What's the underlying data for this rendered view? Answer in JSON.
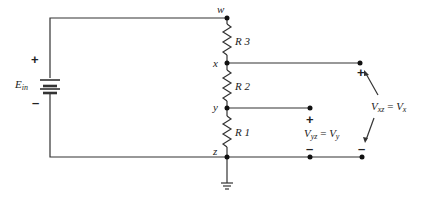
{
  "diagram": {
    "type": "circuit-schematic",
    "colors": {
      "wire": "#333333",
      "text": "#222222",
      "background": "#ffffff"
    },
    "source": {
      "label": "E",
      "label_sub": "in",
      "plus": "+",
      "minus": "–"
    },
    "nodes": {
      "w": "w",
      "x": "x",
      "y": "y",
      "z": "z"
    },
    "resistors": [
      {
        "id": "R3",
        "label": "R 3",
        "between": [
          "w",
          "x"
        ]
      },
      {
        "id": "R2",
        "label": "R 2",
        "between": [
          "x",
          "y"
        ]
      },
      {
        "id": "R1",
        "label": "R 1",
        "between": [
          "y",
          "z"
        ]
      }
    ],
    "measurements": {
      "vyz": {
        "plus": "+",
        "minus": "–",
        "lhs": "V",
        "lhs_sub": "yz",
        "eq": " = ",
        "rhs": "V",
        "rhs_sub": "y"
      },
      "vxz": {
        "plus": "+",
        "minus": "–",
        "lhs": "V",
        "lhs_sub": "xz",
        "eq": " = ",
        "rhs": "V",
        "rhs_sub": "x"
      }
    },
    "ground": "ground-symbol"
  }
}
